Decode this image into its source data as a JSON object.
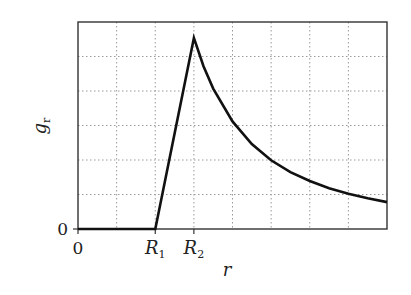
{
  "chart_data": {
    "type": "line",
    "title": "",
    "xlabel": "r",
    "ylabel": "g_r",
    "xlim": [
      0,
      8
    ],
    "ylim": [
      0,
      6
    ],
    "grid": true,
    "x_ticks": [
      {
        "value": 0,
        "label": "0"
      },
      {
        "value": 2,
        "label": "R",
        "sub": "1"
      },
      {
        "value": 3,
        "label": "R",
        "sub": "2"
      }
    ],
    "y_ticks": [
      {
        "value": 0,
        "label": "0"
      }
    ],
    "series": [
      {
        "name": "g_r",
        "x": [
          0,
          2,
          3,
          3.25,
          3.5,
          4,
          4.5,
          5,
          5.5,
          6,
          6.5,
          7,
          7.5,
          8
        ],
        "values": [
          0,
          0,
          5.54,
          4.72,
          4.07,
          3.12,
          2.46,
          1.99,
          1.65,
          1.39,
          1.18,
          1.02,
          0.89,
          0.78
        ]
      }
    ],
    "annotations": [
      "linear rise from R1 to R2",
      "inverse-square decay beyond R2"
    ]
  },
  "colors": {
    "line": "#111111",
    "grid": "#9a9a9a",
    "frame": "#333333"
  }
}
